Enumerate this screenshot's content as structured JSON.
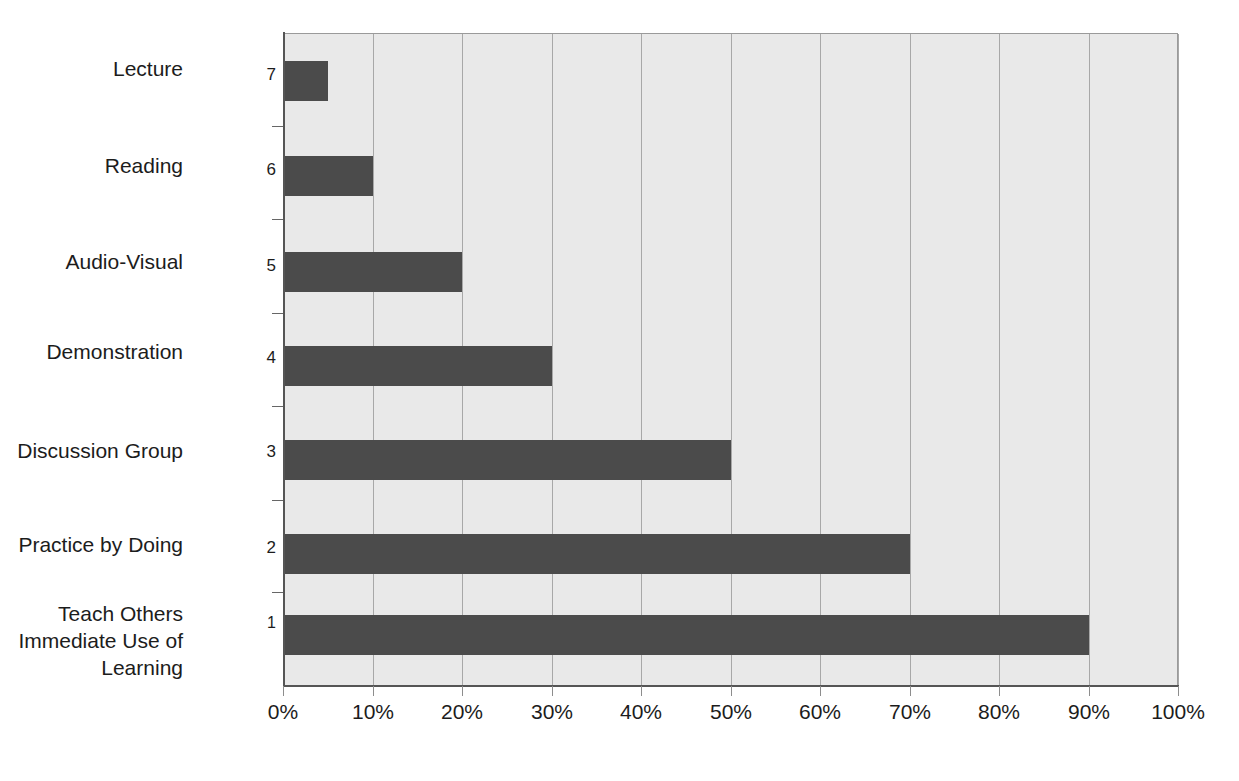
{
  "chart_data": {
    "type": "bar",
    "orientation": "horizontal",
    "title": "",
    "subtitle": "",
    "xlabel": "",
    "ylabel": "",
    "xlim": [
      0,
      100
    ],
    "grid": true,
    "legend": "none",
    "categories": [
      "Teach Others\nImmediate Use of\nLearning",
      "Practice by Doing",
      "Discussion Group",
      "Demonstration",
      "Audio-Visual",
      "Reading",
      "Lecture"
    ],
    "category_numbers": [
      "1",
      "2",
      "3",
      "4",
      "5",
      "6",
      "7"
    ],
    "values": [
      90,
      70,
      50,
      30,
      20,
      10,
      5
    ],
    "xticks": [
      0,
      10,
      20,
      30,
      40,
      50,
      60,
      70,
      80,
      90,
      100
    ],
    "xtick_labels": [
      "0%",
      "10%",
      "20%",
      "30%",
      "40%",
      "50%",
      "60%",
      "70%",
      "80%",
      "90%",
      "100%"
    ],
    "colors": {
      "bar": "#4b4b4b",
      "plot_background": "#e9e9e9",
      "gridline": "#a8a8a8",
      "axis": "#555555",
      "text": "#1c1c1c",
      "page_background": "#ffffff"
    }
  },
  "rows": [
    {
      "label": "Lecture",
      "number": "7",
      "value": 5,
      "value_label": "5%",
      "top": 60,
      "height": 40,
      "label_top": 55,
      "num_top": 65,
      "superscript": false
    },
    {
      "label": "Reading",
      "number": "6",
      "value": 10,
      "value_label": "10%",
      "top": 155,
      "height": 40,
      "label_top": 152,
      "num_top": 160,
      "superscript": false
    },
    {
      "label": "Audio-Visual",
      "number": "5",
      "value": 20,
      "value_label": "20%",
      "top": 251,
      "height": 40,
      "label_top": 248,
      "num_top": 256,
      "superscript": false
    },
    {
      "label": "Demonstration",
      "number": "4",
      "value": 30,
      "value_label": "30%",
      "top": 345,
      "height": 40,
      "label_top": 338,
      "num_top": 348,
      "superscript": false
    },
    {
      "label": "Discussion Group",
      "number": "3",
      "value": 50,
      "value_label": "50%",
      "top": 439,
      "height": 40,
      "label_top": 437,
      "num_top": 442,
      "superscript": false
    },
    {
      "label": "Practice by Doing",
      "number": "2",
      "value": 70,
      "value_label": "70%",
      "top": 533,
      "height": 40,
      "label_top": 531,
      "num_top": 538,
      "superscript": false
    },
    {
      "label": "Teach Others\nImmediate Use of\nLearning",
      "number": "1",
      "value": 90,
      "value_label": "90%",
      "top": 614,
      "height": 40,
      "label_top": 600,
      "num_top": 614,
      "superscript": true
    }
  ]
}
